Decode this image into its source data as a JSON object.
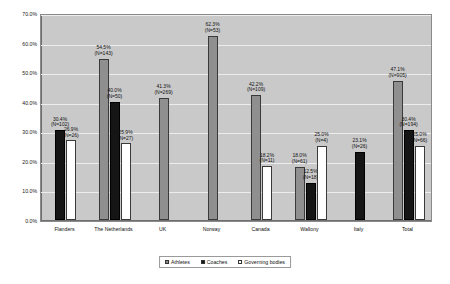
{
  "chart_data": {
    "type": "bar",
    "title": "",
    "xlabel": "",
    "ylabel": "",
    "ylim": [
      0,
      70
    ],
    "ytick_labels": [
      "0.0%",
      "10.0%",
      "20.0%",
      "30.0%",
      "40.0%",
      "50.0%",
      "60.0%",
      "70.0%"
    ],
    "ytick_values": [
      0,
      10,
      20,
      30,
      40,
      50,
      60,
      70
    ],
    "grid": true,
    "legend_position": "bottom",
    "categories": [
      "Flanders",
      "The Netherlands",
      "UK",
      "Norway",
      "Canada",
      "Wallony",
      "Italy",
      "Total"
    ],
    "series": [
      {
        "name": "Athletes",
        "color": "#8f8f8f",
        "values": [
          null,
          54.5,
          41.3,
          62.3,
          42.2,
          18.0,
          null,
          47.1
        ],
        "n": [
          null,
          143,
          269,
          53,
          109,
          61,
          null,
          905
        ],
        "labels": [
          null,
          "54.5%",
          "41.3%",
          "62.3%",
          "42.2%",
          "18.0%",
          null,
          "47.1%"
        ],
        "n_labels": [
          null,
          "(N=143)",
          "(N=269)",
          "(N=53)",
          "(N=109)",
          "(N=61)",
          null,
          "(N=905)"
        ]
      },
      {
        "name": "Coaches",
        "color": "#151515",
        "values": [
          30.4,
          40.0,
          null,
          null,
          null,
          12.5,
          23.1,
          30.4
        ],
        "n": [
          102,
          50,
          null,
          null,
          null,
          18,
          26,
          194
        ],
        "labels": [
          "30.4%",
          "40.0%",
          null,
          null,
          null,
          "12.5%",
          "23.1%",
          "30.4%"
        ],
        "n_labels": [
          "(N=102)",
          "(N=50)",
          null,
          null,
          null,
          "(N=18)",
          "(N=26)",
          "(N=194)"
        ]
      },
      {
        "name": "Governing bodies",
        "color": "#ffffff",
        "values": [
          26.9,
          25.9,
          null,
          null,
          18.2,
          25.0,
          null,
          25.0
        ],
        "n": [
          26,
          27,
          null,
          null,
          11,
          4,
          null,
          66
        ],
        "labels": [
          "26.9%",
          "25.9%",
          null,
          null,
          "18.2%",
          "25.0%",
          null,
          "25.0%"
        ],
        "n_labels": [
          "(N=26)",
          "(N=27)",
          null,
          null,
          "(N=11)",
          "(N=4)",
          null,
          "(N=66)"
        ]
      }
    ]
  },
  "legend": {
    "items": [
      {
        "label": "Athletes"
      },
      {
        "label": "Coaches"
      },
      {
        "label": "Governing bodies"
      }
    ]
  }
}
